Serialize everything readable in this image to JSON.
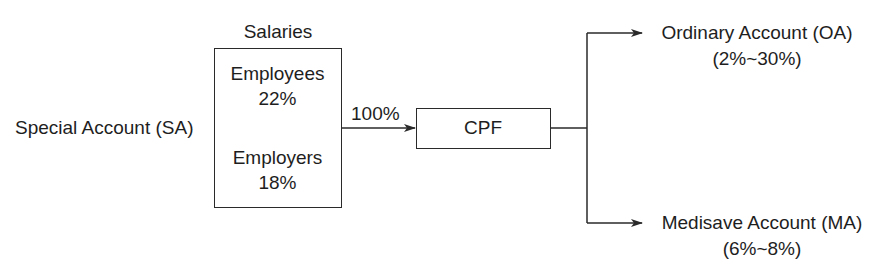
{
  "diagram": {
    "left_label": "Special Account (SA)",
    "salaries": {
      "title": "Salaries",
      "employees_label": "Employees",
      "employees_pct": "22%",
      "employers_label": "Employers",
      "employers_pct": "18%"
    },
    "flow_label": "100%",
    "cpf_label": "CPF",
    "outputs": [
      {
        "label": "Ordinary Account (OA)",
        "range": "(2%~30%)"
      },
      {
        "label": "Medisave Account (MA)",
        "range": "(6%~8%)"
      }
    ],
    "colors": {
      "line": "#2a2a2a",
      "text": "#1e1e1e",
      "background": "#ffffff"
    }
  }
}
